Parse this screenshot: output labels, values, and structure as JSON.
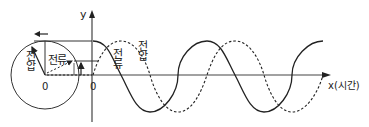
{
  "diagram": {
    "axes": {
      "y_label": "y",
      "x_label": "x(시간)",
      "origin_label_graph": "0",
      "origin_label_circle": "0"
    },
    "circle": {
      "voltage_vector_label": "전압",
      "current_vector_label": "전류",
      "rotation_direction": "counter-clockwise (arrow pointing left at top)"
    },
    "waves": {
      "current_label": "전류",
      "voltage_label": "전압",
      "current_style": "solid",
      "voltage_style": "dashed",
      "phase_relation": "current leads voltage by 90°"
    },
    "colors": {
      "line": "#222222",
      "background": "#ffffff"
    }
  }
}
